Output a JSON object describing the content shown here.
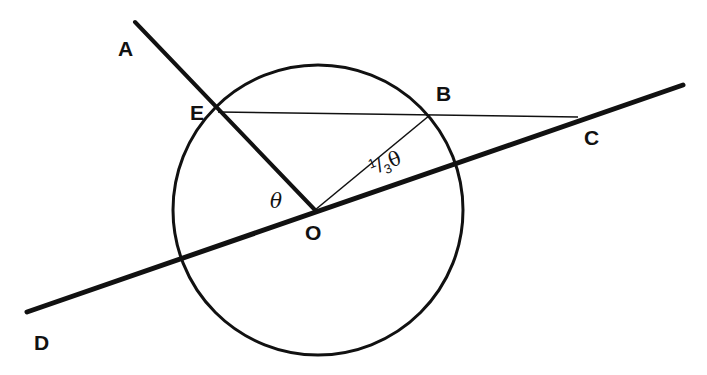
{
  "diagram": {
    "type": "geometry",
    "colors": {
      "stroke": "#111111",
      "background": "#ffffff"
    },
    "circle": {
      "center": "O",
      "cx": 318,
      "cy": 210,
      "r": 146
    },
    "points": {
      "A": {
        "label": "A",
        "x": 135,
        "y": 22
      },
      "E": {
        "label": "E",
        "x": 218,
        "y": 112
      },
      "B": {
        "label": "B",
        "x": 430,
        "y": 115
      },
      "C": {
        "label": "C",
        "x": 578,
        "y": 117
      },
      "O": {
        "label": "O",
        "x": 315,
        "y": 210
      },
      "D": {
        "label": "D",
        "x": 27,
        "y": 312
      }
    },
    "segments": [
      {
        "from": "A",
        "to": "O",
        "weight": "thick"
      },
      {
        "from": "D",
        "to": "C-extended",
        "weight": "thick"
      },
      {
        "from": "E",
        "to": "C",
        "weight": "thin"
      },
      {
        "from": "O",
        "to": "B",
        "weight": "thin"
      }
    ],
    "angles": {
      "theta": {
        "label": "θ",
        "at": "O",
        "between": [
          "OE",
          "OD"
        ]
      },
      "third_theta": {
        "num": "1",
        "slash": "/",
        "den": "3",
        "symbol": "θ",
        "at": "O",
        "between": [
          "OB",
          "OC"
        ]
      }
    }
  }
}
